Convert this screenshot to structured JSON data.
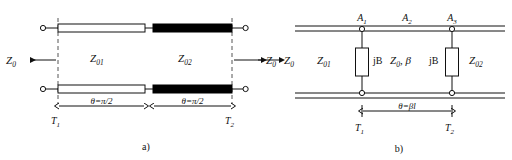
{
  "figure": {
    "title": "",
    "panels": [
      {
        "id": "a",
        "caption": "a)",
        "port_left_label": "Z0",
        "port_left_label_html": "Z₀",
        "port_right_label_html": "Z₀",
        "section1_impedance": "Z₀₁",
        "section2_impedance": "Z₀₂",
        "dim1_label": "θ=π/2",
        "dim2_label": "θ=π/2",
        "ref_plane_left": "T₁",
        "ref_plane_right": "T₂",
        "section1_fill": "#ffffff",
        "section2_fill": "#000000"
      },
      {
        "id": "b",
        "caption": "b)",
        "port_left_label_html": "Z₀",
        "node_labels": [
          "A₁",
          "A₂",
          "A₃"
        ],
        "left_impedance": "Z₀₁",
        "right_impedance": "Z₀₂",
        "line_label": "Z₀, β",
        "shunt_left_label": "jB",
        "shunt_right_label": "jB",
        "dim_label": "θ=βl",
        "ref_plane_left": "T₁",
        "ref_plane_right": "T₂",
        "shunt_fill": "#ffffff"
      }
    ],
    "colors": {
      "line": "#111111",
      "dash": "#555555",
      "background": "#ffffff",
      "filled_section": "#000000"
    }
  }
}
